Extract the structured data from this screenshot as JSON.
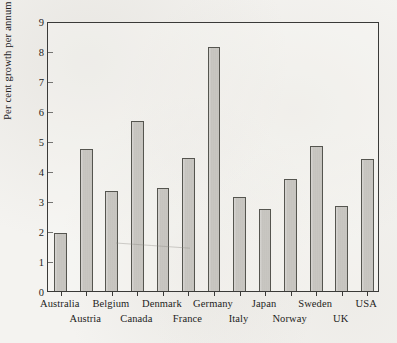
{
  "chart_data": {
    "type": "bar",
    "title": "",
    "subtitle": "",
    "xlabel": "",
    "ylabel": "Per cent growth per annum",
    "ylim": [
      0,
      9
    ],
    "ytick_labels": [
      "0",
      "1",
      "2",
      "3",
      "4",
      "5",
      "6",
      "7",
      "8",
      "9"
    ],
    "ytick_values": [
      0,
      1,
      2,
      3,
      4,
      5,
      6,
      7,
      8,
      9
    ],
    "grid": false,
    "legend": null,
    "legend_position": "none",
    "annotations": [],
    "xtick_label_layout": "staggered-two-rows",
    "categories": [
      "Australia",
      "Austria",
      "Belgium",
      "Canada",
      "Denmark",
      "France",
      "Germany",
      "Italy",
      "Japan",
      "Norway",
      "Sweden",
      "UK",
      "USA"
    ],
    "values": [
      1.95,
      4.75,
      3.35,
      5.67,
      3.45,
      4.45,
      8.15,
      3.15,
      2.75,
      3.75,
      4.85,
      2.85,
      4.4
    ]
  },
  "style": {
    "bar_fill": "#c7c5c0",
    "bar_border": "#55554f",
    "axis_color": "#3a3a38",
    "text_color": "#1d1d1b",
    "paper": "#f4f3f0"
  }
}
